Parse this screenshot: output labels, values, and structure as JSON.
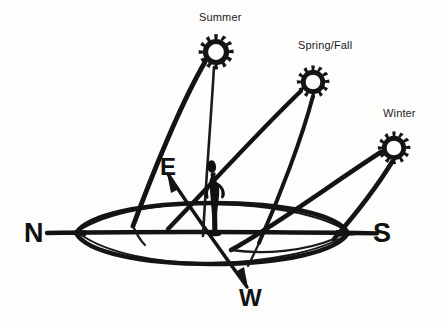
{
  "figure": {
    "type": "hand-drawn seasonal sun path over horizon",
    "background_color": "#fdfdfc",
    "ink_color": "#111111",
    "width": 442,
    "height": 327
  },
  "season_labels": {
    "summer": "Summer",
    "spring_fall": "Spring/Fall",
    "winter": "Winter"
  },
  "compass_labels": {
    "north": "N",
    "south": "S",
    "east": "E",
    "west": "W"
  },
  "suns": [
    {
      "name": "summer-sun",
      "label": "Summer",
      "cx": 216,
      "cy": 52,
      "r": 13,
      "rays": 11
    },
    {
      "name": "spring-fall-sun",
      "label": "Spring/Fall",
      "cx": 313,
      "cy": 82,
      "r": 12,
      "rays": 11
    },
    {
      "name": "winter-sun",
      "label": "Winter",
      "cx": 394,
      "cy": 148,
      "r": 12,
      "rays": 11
    }
  ],
  "observer": {
    "name": "person-silhouette",
    "description": "standing figure with hands on hips at center of horizon",
    "x": 214,
    "y": 198
  },
  "horizon": {
    "name": "horizon-ellipse",
    "cx": 212,
    "cy": 233,
    "rx": 137,
    "ry": 29
  },
  "axes": [
    {
      "name": "north-south-axis",
      "from_label": "N",
      "to_label": "S",
      "x1": 48,
      "y1": 233,
      "x2": 376,
      "y2": 233
    },
    {
      "name": "east-west-axis",
      "from_label": "E",
      "to_label": "W",
      "x1": 168,
      "y1": 175,
      "x2": 248,
      "y2": 288
    }
  ],
  "sun_paths": [
    {
      "name": "summer-sun-path",
      "season": "Summer",
      "rise_x": 135,
      "rise_y": 225,
      "peak_x": 216,
      "peak_y": 52,
      "set_x": 205,
      "set_y": 233
    },
    {
      "name": "spring-fall-sun-path",
      "season": "Spring/Fall",
      "rise_x": 168,
      "rise_y": 228,
      "peak_x": 313,
      "peak_y": 82,
      "set_x": 258,
      "set_y": 242
    },
    {
      "name": "winter-sun-path",
      "season": "Winter",
      "rise_x": 232,
      "rise_y": 250,
      "peak_x": 394,
      "peak_y": 148,
      "set_x": 330,
      "set_y": 248
    }
  ]
}
